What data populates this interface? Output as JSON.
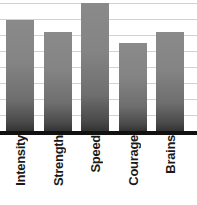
{
  "chart_data": {
    "type": "bar",
    "title": "",
    "subtitle": "",
    "xlabel": "",
    "ylabel": "",
    "categories": [
      "Intensity",
      "Strength",
      "Speed",
      "Courage",
      "Brains"
    ],
    "values": [
      87,
      78,
      100,
      69,
      78
    ],
    "ylim": [
      0,
      103
    ],
    "grid": true,
    "gridline_count": 8,
    "legend": false,
    "legend_position": "none",
    "tick_labels_x": [
      "Intensity",
      "Strength",
      "Speed",
      "Courage",
      "Brains"
    ],
    "tick_labels_y": [],
    "annotations": [],
    "series": [
      {
        "name": "Attribute score",
        "values": [
          87,
          78,
          100,
          69,
          78
        ]
      }
    ],
    "bar_label_rotation_deg": 90,
    "colors": {
      "bar_top": "#8a8a8a",
      "bar_bottom": "#333333",
      "gridline": "#d2d2d2",
      "axis": "#111111",
      "label_text": "#1a1a1a",
      "background": "#ffffff"
    },
    "geometry": {
      "plot_height_px": 131,
      "baseline_y_px": 131,
      "bars": [
        {
          "category": "Intensity",
          "x_px": 6,
          "width_px": 28,
          "top_y_px": 20,
          "height_px": 111
        },
        {
          "category": "Strength",
          "x_px": 44,
          "width_px": 28,
          "top_y_px": 32,
          "height_px": 99
        },
        {
          "category": "Speed",
          "x_px": 81,
          "width_px": 28,
          "top_y_px": 3,
          "height_px": 128
        },
        {
          "category": "Courage",
          "x_px": 119,
          "width_px": 28,
          "top_y_px": 43,
          "height_px": 88
        },
        {
          "category": "Brains",
          "x_px": 156,
          "width_px": 28,
          "top_y_px": 32,
          "height_px": 99
        }
      ],
      "gridlines_y_px": [
        3,
        19,
        35,
        51,
        67,
        83,
        99,
        115
      ]
    }
  }
}
